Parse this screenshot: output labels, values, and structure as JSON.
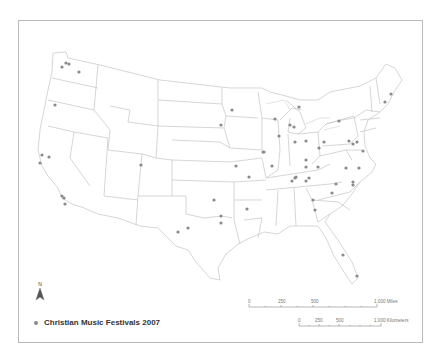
{
  "map": {
    "title": "Christian Music Festivals 2007",
    "legend": {
      "symbol": "gray-dot",
      "label": "Christian Music Festivals 2007",
      "dot_color": "#8a8a8a"
    },
    "north_arrow": {
      "label": "N"
    },
    "scale_bars": {
      "miles": {
        "ticks": [
          "0",
          "250",
          "500",
          "1,000"
        ],
        "unit": "Miles",
        "label_end": "1,000 Miles"
      },
      "kilometers": {
        "ticks": [
          "0",
          "250",
          "500",
          "1,000"
        ],
        "unit": "Kilometers",
        "label_end": "1,000 Kilometers"
      }
    },
    "colors": {
      "state_outline": "#bdbdbd",
      "frame": "#b9b9b9",
      "dot": "#8a8a8a"
    },
    "festival_points": [
      {
        "x": 66,
        "y": 63
      },
      {
        "x": 69,
        "y": 64
      },
      {
        "x": 62,
        "y": 67
      },
      {
        "x": 79,
        "y": 72
      },
      {
        "x": 55,
        "y": 105
      },
      {
        "x": 42,
        "y": 155
      },
      {
        "x": 49,
        "y": 157
      },
      {
        "x": 40,
        "y": 163
      },
      {
        "x": 62,
        "y": 196
      },
      {
        "x": 64,
        "y": 198
      },
      {
        "x": 65,
        "y": 204
      },
      {
        "x": 141,
        "y": 165
      },
      {
        "x": 232,
        "y": 110
      },
      {
        "x": 221,
        "y": 125
      },
      {
        "x": 263,
        "y": 152
      },
      {
        "x": 236,
        "y": 166
      },
      {
        "x": 249,
        "y": 177
      },
      {
        "x": 214,
        "y": 200
      },
      {
        "x": 247,
        "y": 209
      },
      {
        "x": 221,
        "y": 216
      },
      {
        "x": 221,
        "y": 223
      },
      {
        "x": 188,
        "y": 228
      },
      {
        "x": 178,
        "y": 232
      },
      {
        "x": 275,
        "y": 119
      },
      {
        "x": 299,
        "y": 107
      },
      {
        "x": 290,
        "y": 125
      },
      {
        "x": 294,
        "y": 127
      },
      {
        "x": 279,
        "y": 136
      },
      {
        "x": 295,
        "y": 142
      },
      {
        "x": 264,
        "y": 152
      },
      {
        "x": 272,
        "y": 166
      },
      {
        "x": 306,
        "y": 141
      },
      {
        "x": 324,
        "y": 142
      },
      {
        "x": 319,
        "y": 148
      },
      {
        "x": 339,
        "y": 121
      },
      {
        "x": 306,
        "y": 160
      },
      {
        "x": 306,
        "y": 167
      },
      {
        "x": 318,
        "y": 167
      },
      {
        "x": 296,
        "y": 177
      },
      {
        "x": 295,
        "y": 178
      },
      {
        "x": 349,
        "y": 141
      },
      {
        "x": 357,
        "y": 142
      },
      {
        "x": 353,
        "y": 144
      },
      {
        "x": 363,
        "y": 151
      },
      {
        "x": 346,
        "y": 168
      },
      {
        "x": 359,
        "y": 168
      },
      {
        "x": 353,
        "y": 182
      },
      {
        "x": 385,
        "y": 102
      },
      {
        "x": 391,
        "y": 94
      },
      {
        "x": 292,
        "y": 181
      },
      {
        "x": 306,
        "y": 181
      },
      {
        "x": 309,
        "y": 178
      },
      {
        "x": 313,
        "y": 200
      },
      {
        "x": 336,
        "y": 184
      },
      {
        "x": 353,
        "y": 185
      },
      {
        "x": 332,
        "y": 193
      },
      {
        "x": 343,
        "y": 255
      },
      {
        "x": 357,
        "y": 276
      },
      {
        "x": 315,
        "y": 210
      }
    ]
  }
}
